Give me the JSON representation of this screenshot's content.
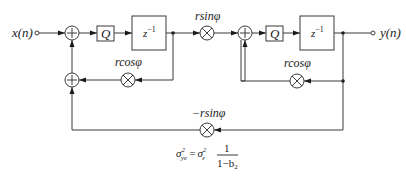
{
  "diagram": {
    "type": "signal-flow-block-diagram",
    "input": {
      "label": "x(n)"
    },
    "output": {
      "label": "y(n)"
    },
    "blocks": [
      {
        "id": "q1",
        "label": "Q"
      },
      {
        "id": "delay1",
        "label": "z",
        "exponent": "−1"
      },
      {
        "id": "q2",
        "label": "Q"
      },
      {
        "id": "delay2",
        "label": "z",
        "exponent": "−1"
      }
    ],
    "multipliers": [
      {
        "id": "m_cos1",
        "label": "rcosφ"
      },
      {
        "id": "m_sin",
        "label": "rsinφ"
      },
      {
        "id": "m_cos2",
        "label": "rcosφ"
      },
      {
        "id": "m_negsin",
        "label": "−rsinφ"
      }
    ],
    "adders": [
      {
        "id": "add1",
        "symbol": "+"
      },
      {
        "id": "add2",
        "symbol": "+"
      },
      {
        "id": "add3",
        "symbol": "+"
      }
    ],
    "formula": {
      "lhs_symbol": "σ",
      "lhs_sup": "2",
      "lhs_sub": "ye",
      "equals": "=",
      "rhs_symbol": "σ",
      "rhs_sup": "2",
      "rhs_sub": "ε",
      "numerator": "1",
      "denominator": "1−b",
      "denominator_sub": "2"
    }
  }
}
